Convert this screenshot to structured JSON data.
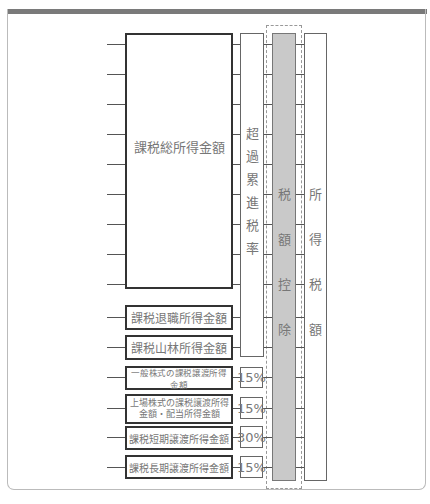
{
  "diagram": {
    "main_income_box": "課税総所得金額",
    "other_boxes": [
      {
        "label": "課税退職所得金額"
      },
      {
        "label": "課税山林所得金額"
      }
    ],
    "separate_boxes": [
      {
        "label": "一般株式の課税譲渡所得金額",
        "rate": "15%"
      },
      {
        "label_line1": "上場株式の課税譲渡所得",
        "label_line2": "金額・配当所得金額",
        "rate": "15%"
      },
      {
        "label": "課税短期譲渡所得金額",
        "rate": "30%"
      },
      {
        "label": "課税長期譲渡所得金額",
        "rate": "15%"
      }
    ],
    "progressive_rate_column": [
      "超",
      "過",
      "累",
      "進",
      "税",
      "率"
    ],
    "tax_credit_column": [
      "税",
      "額",
      "控",
      "除"
    ],
    "income_tax_column": [
      "所",
      "得",
      "税",
      "額"
    ],
    "colors": {
      "tax_credit_fill": "#c9c9c9",
      "top_bar": "#7a7a7a",
      "box_border": "#333333"
    }
  }
}
